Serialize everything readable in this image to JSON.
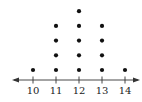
{
  "chart_data": {
    "type": "dot",
    "title": "",
    "xlabel": "",
    "ylabel": "",
    "categories": [
      "10",
      "11",
      "12",
      "13",
      "14"
    ],
    "x": [
      10,
      11,
      12,
      13,
      14
    ],
    "values": [
      1,
      4,
      5,
      4,
      1
    ],
    "tick_labels": [
      "10",
      "11",
      "12",
      "13",
      "14"
    ],
    "xlim": [
      9.5,
      14.6
    ],
    "axis": "number line with arrows at both ends",
    "grid": false,
    "legend": null,
    "colors": {
      "dot": "#111111",
      "axis": "#333333"
    }
  }
}
